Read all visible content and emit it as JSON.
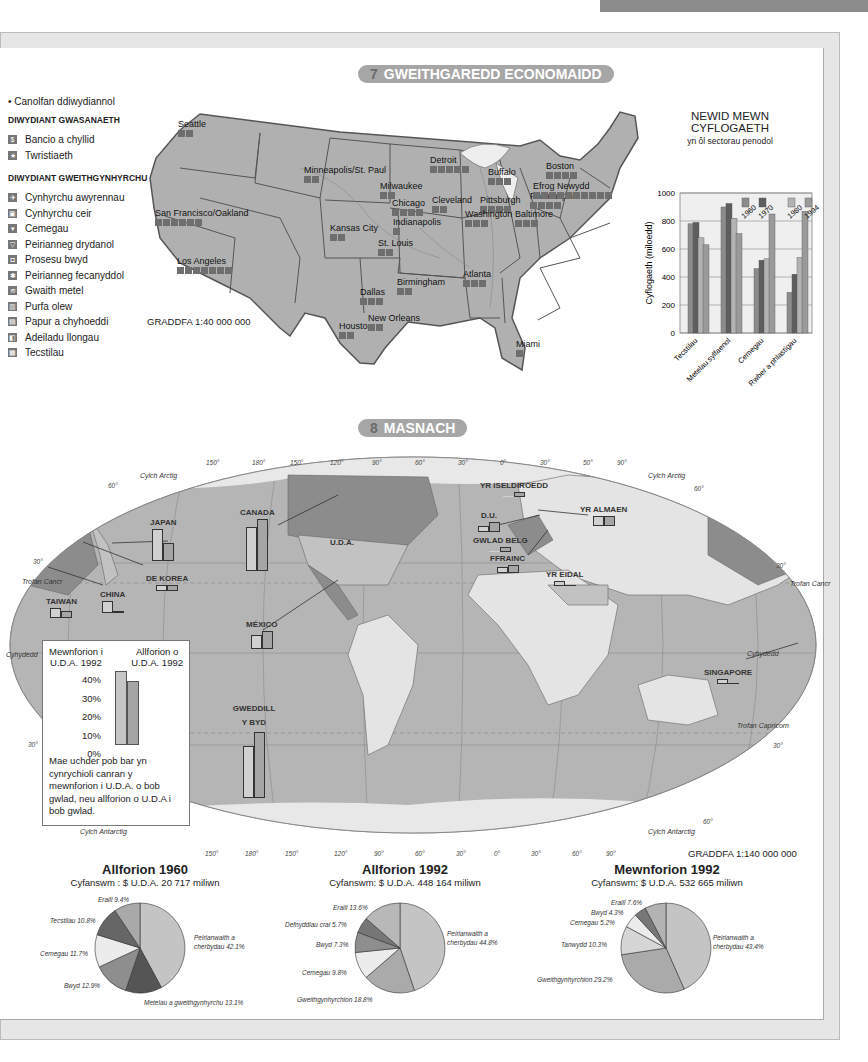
{
  "section7": {
    "number": "7",
    "title": "GWEITHGAREDD ECONOMAIDD",
    "scale": "GRADDFA 1:40 000 000",
    "legend": {
      "hub_label": "Canolfan ddiwydiannol",
      "service_header": "DIWYDIANT GWASANAETH",
      "service_items": [
        {
          "icon": "dollar-icon",
          "glyph": "$",
          "label": "Bancio a chyllid"
        },
        {
          "icon": "star-icon",
          "glyph": "★",
          "label": "Twristiaeth"
        }
      ],
      "manufacturing_header": "DIWYDIANT GWEITHGYNHYRCHU",
      "manufacturing_items": [
        {
          "icon": "airplane-icon",
          "glyph": "✈",
          "label": "Cynhyrchu awyrennau"
        },
        {
          "icon": "car-icon",
          "glyph": "▣",
          "label": "Cynhyrchu ceir"
        },
        {
          "icon": "flask-icon",
          "glyph": "▾",
          "label": "Cemegau"
        },
        {
          "icon": "bulb-icon",
          "glyph": "▽",
          "label": "Peirianneg drydanol"
        },
        {
          "icon": "food-icon",
          "glyph": "◘",
          "label": "Prosesu bwyd"
        },
        {
          "icon": "gear-icon",
          "glyph": "✱",
          "label": "Peirianneg fecanyddol"
        },
        {
          "icon": "metal-icon",
          "glyph": "≋",
          "label": "Gwaith metel"
        },
        {
          "icon": "refinery-icon",
          "glyph": "▥",
          "label": "Purfa olew"
        },
        {
          "icon": "paper-icon",
          "glyph": "▤",
          "label": "Papur a chyhoeddi"
        },
        {
          "icon": "ship-icon",
          "glyph": "◧",
          "label": "Adeiladu llongau"
        },
        {
          "icon": "textile-icon",
          "glyph": "▦",
          "label": "Tecstilau"
        }
      ]
    },
    "cities": [
      {
        "name": "Seattle",
        "x": 178,
        "y": 124,
        "icons": 2
      },
      {
        "name": "San Francisco/Oakland",
        "x": 155,
        "y": 213,
        "icons": 6
      },
      {
        "name": "Los Angeles",
        "x": 177,
        "y": 261,
        "icons": 7
      },
      {
        "name": "Minneapolis/St. Paul",
        "x": 304,
        "y": 170,
        "icons": 2
      },
      {
        "name": "Milwaukee",
        "x": 380,
        "y": 186,
        "icons": 2
      },
      {
        "name": "Chicago",
        "x": 392,
        "y": 203,
        "icons": 4
      },
      {
        "name": "Indianapolis",
        "x": 393,
        "y": 222,
        "icons": 1
      },
      {
        "name": "Kansas City",
        "x": 330,
        "y": 228,
        "icons": 2
      },
      {
        "name": "St. Louis",
        "x": 378,
        "y": 243,
        "icons": 2
      },
      {
        "name": "Detroit",
        "x": 430,
        "y": 160,
        "icons": 5
      },
      {
        "name": "Cleveland",
        "x": 432,
        "y": 200,
        "icons": 2
      },
      {
        "name": "Buffalo",
        "x": 488,
        "y": 172,
        "icons": 3
      },
      {
        "name": "Pittsburgh",
        "x": 480,
        "y": 200,
        "icons": 4
      },
      {
        "name": "Washington",
        "x": 465,
        "y": 214,
        "icons": 3
      },
      {
        "name": "Baltimore",
        "x": 515,
        "y": 214,
        "icons": 3
      },
      {
        "name": "Philadelphia",
        "x": 530,
        "y": 196,
        "icons": 4
      },
      {
        "name": "Efrog Newydd",
        "x": 533,
        "y": 186,
        "icons": 10
      },
      {
        "name": "Boston",
        "x": 546,
        "y": 166,
        "icons": 4
      },
      {
        "name": "Birmingham",
        "x": 397,
        "y": 282,
        "icons": 2
      },
      {
        "name": "Atlanta",
        "x": 463,
        "y": 274,
        "icons": 3
      },
      {
        "name": "Dallas",
        "x": 360,
        "y": 292,
        "icons": 3
      },
      {
        "name": "Houston",
        "x": 339,
        "y": 326,
        "icons": 2
      },
      {
        "name": "New Orleans",
        "x": 368,
        "y": 318,
        "icons": 2
      },
      {
        "name": "Miami",
        "x": 516,
        "y": 344,
        "icons": 1
      }
    ]
  },
  "employment_chart": {
    "title_line1": "NEWID MEWN",
    "title_line2": "CYFLOGAETH",
    "subtitle": "yn ôl sectorau penodol",
    "ylabel": "Cyflogaeth (miloedd)",
    "yticks": [
      "0",
      "200",
      "400",
      "600",
      "800",
      "1000"
    ],
    "legend": [
      "1960",
      "1970",
      "1980",
      "1994"
    ]
  },
  "chart_data": [
    {
      "type": "bar",
      "title": "NEWID MEWN CYFLOGAETH",
      "subtitle": "yn ôl sectorau penodol",
      "xlabel": "",
      "ylabel": "Cyflogaeth (miloedd)",
      "ylim": [
        0,
        1000
      ],
      "grid": true,
      "categories": [
        "Tecstilau",
        "Metelau sylfaenol",
        "Cemegau",
        "Rwber a phlastigau"
      ],
      "series": [
        {
          "name": "1960",
          "values": [
            780,
            900,
            460,
            290
          ],
          "color": "#8c8c8c"
        },
        {
          "name": "1970",
          "values": [
            790,
            925,
            520,
            420
          ],
          "color": "#5e5e5e"
        },
        {
          "name": "1980",
          "values": [
            680,
            820,
            530,
            540
          ],
          "color": "#b3b3b3"
        },
        {
          "name": "1994",
          "values": [
            630,
            710,
            850,
            870
          ],
          "color": "#9a9a9a"
        }
      ],
      "legend_position": "top-right inside"
    },
    {
      "type": "pie",
      "title": "Allforion 1960",
      "subtitle": "Cyfanswm : $ U.D.A. 20 717 miliwn",
      "slices": [
        {
          "label": "Peirianwaith a cherbydau",
          "value": 42.1,
          "color": "#c4c4c4"
        },
        {
          "label": "Metelau a gweithgynhyrchu",
          "value": 13.1,
          "color": "#555555"
        },
        {
          "label": "Bwyd",
          "value": 12.9,
          "color": "#8e8e8e"
        },
        {
          "label": "Cemegau",
          "value": 11.7,
          "color": "#ececec"
        },
        {
          "label": "Tecstilau",
          "value": 10.8,
          "color": "#666666"
        },
        {
          "label": "Eraill",
          "value": 9.4,
          "color": "#a9a9a9"
        }
      ]
    },
    {
      "type": "pie",
      "title": "Allforion 1992",
      "subtitle": "Cyfanswm: $ U.D.A. 448 164 miliwn",
      "slices": [
        {
          "label": "Peirianwaith a cherbydau",
          "value": 44.8,
          "color": "#c4c4c4"
        },
        {
          "label": "Gweithgynhyrchion",
          "value": 18.8,
          "color": "#aaaaaa"
        },
        {
          "label": "Cemegau",
          "value": 9.8,
          "color": "#ececec"
        },
        {
          "label": "Bwyd",
          "value": 7.3,
          "color": "#8e8e8e"
        },
        {
          "label": "Defnyddiau crai",
          "value": 5.7,
          "color": "#777777"
        },
        {
          "label": "Eraill",
          "value": 13.6,
          "color": "#b8b8b8"
        }
      ]
    },
    {
      "type": "pie",
      "title": "Mewnforion 1992",
      "subtitle": "Cyfanswm: $ U.D.A. 532 665 miliwn",
      "slices": [
        {
          "label": "Peirianwaith a cherbydau",
          "value": 43.4,
          "color": "#c4c4c4"
        },
        {
          "label": "Gweithgynhyrchion",
          "value": 29.2,
          "color": "#aaaaaa"
        },
        {
          "label": "Tanwydd",
          "value": 10.3,
          "color": "#d6d6d6"
        },
        {
          "label": "Cemegau",
          "value": 5.2,
          "color": "#ececec"
        },
        {
          "label": "Bwyd",
          "value": 4.3,
          "color": "#777777"
        },
        {
          "label": "Eraill",
          "value": 7.6,
          "color": "#b3b3b3"
        }
      ]
    },
    {
      "type": "bar",
      "title": "Masnach U.D.A. 1992 yn ôl gwlad",
      "ylabel": "%",
      "ylim": [
        0,
        40
      ],
      "categories": [
        "Canada",
        "Japan",
        "México",
        "Gweddill y Byd",
        "Taiwan",
        "China",
        "De Korea",
        "D.U.",
        "Yr Almaen",
        "Yr Iseldiroedd",
        "Gwlad Belg",
        "Ffrainc",
        "Yr Eidal",
        "Singapore"
      ],
      "series": [
        {
          "name": "Mewnforion i U.D.A. 1992",
          "values": [
            18,
            18,
            7,
            30,
            5,
            6,
            3,
            4,
            6,
            1,
            1,
            3,
            3,
            2
          ]
        },
        {
          "name": "Allforion o U.D.A. 1992",
          "values": [
            22,
            10,
            9,
            34,
            4,
            2,
            3,
            5,
            5,
            3,
            2,
            3,
            2,
            2
          ]
        }
      ],
      "inset_example": {
        "imports": 40,
        "exports": 35
      }
    }
  ],
  "section8": {
    "number": "8",
    "title": "MASNACH",
    "scale": "GRADDFA 1:140 000 000",
    "countries": [
      {
        "name": "CANADA",
        "x": 240,
        "y": 508,
        "imp": 44,
        "exp": 52
      },
      {
        "name": "U.D.A.",
        "x": 330,
        "y": 538,
        "imp": 0,
        "exp": 0
      },
      {
        "name": "JAPAN",
        "x": 150,
        "y": 518,
        "imp": 32,
        "exp": 18
      },
      {
        "name": "DE KOREA",
        "x": 146,
        "y": 574,
        "imp": 6,
        "exp": 6
      },
      {
        "name": "TAIWAN",
        "x": 46,
        "y": 597,
        "imp": 10,
        "exp": 7
      },
      {
        "name": "CHINA",
        "x": 100,
        "y": 590,
        "imp": 12,
        "exp": 2
      },
      {
        "name": "MÉXICO",
        "x": 246,
        "y": 620,
        "imp": 14,
        "exp": 18
      },
      {
        "name": "GWEDDILL Y BYD",
        "x": 232,
        "y": 702,
        "imp": 52,
        "exp": 66
      },
      {
        "name": "YR ISELDIROEDD",
        "x": 480,
        "y": 481,
        "imp": 0,
        "exp": 5
      },
      {
        "name": "D.U.",
        "x": 478,
        "y": 511,
        "imp": 6,
        "exp": 10
      },
      {
        "name": "YR ALMAEN",
        "x": 580,
        "y": 505,
        "imp": 10,
        "exp": 10
      },
      {
        "name": "GWLAD BELG",
        "x": 473,
        "y": 536,
        "imp": 0,
        "exp": 5
      },
      {
        "name": "FFRAINC",
        "x": 490,
        "y": 554,
        "imp": 6,
        "exp": 8
      },
      {
        "name": "YR EIDAL",
        "x": 546,
        "y": 570,
        "imp": 5,
        "exp": 0
      },
      {
        "name": "SINGAPORE",
        "x": 704,
        "y": 668,
        "imp": 5,
        "exp": 0
      }
    ],
    "map_labels": [
      {
        "text": "Cylch Arctig",
        "x": 140,
        "y": 472
      },
      {
        "text": "Cylch Arctig",
        "x": 648,
        "y": 472
      },
      {
        "text": "Trofan Cancr",
        "x": 22,
        "y": 578
      },
      {
        "text": "Trofan Cancr",
        "x": 790,
        "y": 580
      },
      {
        "text": "Cyhydedd",
        "x": 6,
        "y": 651
      },
      {
        "text": "Cyhydedd",
        "x": 747,
        "y": 650
      },
      {
        "text": "Trofan Capricorn",
        "x": 737,
        "y": 722
      },
      {
        "text": "Cylch Antarctig",
        "x": 80,
        "y": 828
      },
      {
        "text": "Cylch Antarctig",
        "x": 648,
        "y": 828
      }
    ],
    "degree_labels": [
      {
        "text": "150°",
        "x": 206,
        "y": 459
      },
      {
        "text": "180°",
        "x": 252,
        "y": 459
      },
      {
        "text": "150°",
        "x": 290,
        "y": 459
      },
      {
        "text": "120°",
        "x": 330,
        "y": 459
      },
      {
        "text": "90°",
        "x": 372,
        "y": 459
      },
      {
        "text": "60°",
        "x": 415,
        "y": 459
      },
      {
        "text": "30°",
        "x": 458,
        "y": 459
      },
      {
        "text": "0°",
        "x": 500,
        "y": 459
      },
      {
        "text": "30°",
        "x": 540,
        "y": 459
      },
      {
        "text": "50°",
        "x": 583,
        "y": 459
      },
      {
        "text": "90°",
        "x": 617,
        "y": 459
      },
      {
        "text": "60°",
        "x": 108,
        "y": 482
      },
      {
        "text": "60°",
        "x": 694,
        "y": 485
      },
      {
        "text": "30°",
        "x": 33,
        "y": 558
      },
      {
        "text": "30°",
        "x": 776,
        "y": 562
      },
      {
        "text": "30°",
        "x": 28,
        "y": 741
      },
      {
        "text": "30°",
        "x": 773,
        "y": 742
      },
      {
        "text": "60°",
        "x": 703,
        "y": 818
      },
      {
        "text": "150°",
        "x": 205,
        "y": 850
      },
      {
        "text": "180°",
        "x": 245,
        "y": 850
      },
      {
        "text": "150°",
        "x": 285,
        "y": 850
      },
      {
        "text": "120°",
        "x": 334,
        "y": 850
      },
      {
        "text": "90°",
        "x": 374,
        "y": 850
      },
      {
        "text": "60°",
        "x": 415,
        "y": 850
      },
      {
        "text": "30°",
        "x": 456,
        "y": 850
      },
      {
        "text": "0°",
        "x": 494,
        "y": 850
      },
      {
        "text": "30°",
        "x": 531,
        "y": 850
      },
      {
        "text": "60°",
        "x": 572,
        "y": 850
      },
      {
        "text": "90°",
        "x": 606,
        "y": 850
      }
    ],
    "inset": {
      "imports_label_1": "Mewnforion i",
      "imports_label_2": "U.D.A. 1992",
      "exports_label_1": "Allforion o",
      "exports_label_2": "U.D.A. 1992",
      "yticks": [
        "40%",
        "30%",
        "20%",
        "10%",
        "0%"
      ],
      "description": "Mae uchder pob bar yn cynrychioli canran y mewnforion i U.D.A. o bob gwlad, neu allforion o U.D.A i bob gwlad."
    }
  },
  "pies": [
    {
      "title": "Allforion 1960",
      "total": "Cyfanswm : $ U.D.A. 20 717 miliwn",
      "labels": [
        {
          "text": "Eraill 9.4%",
          "x": 98,
          "y": 896
        },
        {
          "text": "Tecstilau 10.8%",
          "x": 50,
          "y": 917
        },
        {
          "text": "Cemegau 11.7%",
          "x": 40,
          "y": 950
        },
        {
          "text": "Bwyd 12.9%",
          "x": 64,
          "y": 982
        },
        {
          "text": "Peirianwaith a",
          "x": 194,
          "y": 934
        },
        {
          "text": "cherbydau 42.1%",
          "x": 194,
          "y": 943
        },
        {
          "text": "Metelau a gweithgynhyrchu 13.1%",
          "x": 144,
          "y": 999
        }
      ]
    },
    {
      "title": "Allforion 1992",
      "total": "Cyfanswm: $ U.D.A. 448 164 miliwn",
      "labels": [
        {
          "text": "Eraill 13.6%",
          "x": 333,
          "y": 904
        },
        {
          "text": "Defnyddiau crai 5.7%",
          "x": 285,
          "y": 921
        },
        {
          "text": "Bwyd 7.3%",
          "x": 316,
          "y": 941
        },
        {
          "text": "Cemegau 9.8%",
          "x": 302,
          "y": 969
        },
        {
          "text": "Peirianwaith a",
          "x": 447,
          "y": 930
        },
        {
          "text": "cherbydau 44.8%",
          "x": 447,
          "y": 939
        },
        {
          "text": "Gweithgynhyrchion 18.8%",
          "x": 297,
          "y": 996
        }
      ]
    },
    {
      "title": "Mewnforion 1992",
      "total": "Cyfanswm: $ U.D.A. 532 665 miliwn",
      "labels": [
        {
          "text": "Eraill 7.6%",
          "x": 611,
          "y": 899
        },
        {
          "text": "Bwyd 4.3%",
          "x": 591,
          "y": 909
        },
        {
          "text": "Cemegau 5.2%",
          "x": 570,
          "y": 919
        },
        {
          "text": "Tanwydd 10.3%",
          "x": 561,
          "y": 941
        },
        {
          "text": "Peirianwaith a",
          "x": 713,
          "y": 934
        },
        {
          "text": "cherbydau 43.4%",
          "x": 713,
          "y": 943
        },
        {
          "text": "Gweithgynhyrchion 29.2%",
          "x": 537,
          "y": 976
        }
      ]
    }
  ]
}
